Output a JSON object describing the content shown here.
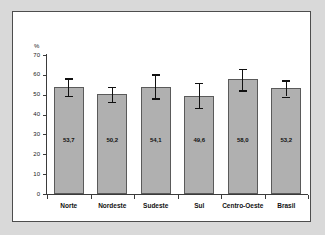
{
  "chart_data": {
    "type": "bar",
    "title": "",
    "xlabel": "",
    "ylabel": "%",
    "ylim": [
      0,
      70
    ],
    "ytick_labels": [
      "70",
      "60",
      "50",
      "40",
      "30",
      "20",
      "10",
      "0"
    ],
    "yticks": [
      70,
      60,
      50,
      40,
      30,
      20,
      10,
      0
    ],
    "grid": false,
    "legend": "none",
    "categories": [
      "Norte",
      "Nordeste",
      "Sudeste",
      "Sul",
      "Centro-Oeste",
      "Brasil"
    ],
    "values": [
      53.7,
      50.2,
      54.1,
      49.6,
      58.0,
      53.2
    ],
    "value_labels": [
      "53,7",
      "50,2",
      "54,1",
      "49,6",
      "58,0",
      "53,2"
    ],
    "error_bars": {
      "lower": [
        49.5,
        46.4,
        48.1,
        43.4,
        52.3,
        49.1
      ],
      "upper": [
        58.2,
        54.0,
        60.3,
        56.0,
        63.1,
        57.3
      ]
    },
    "bar_fill_color": "#b0b0b0",
    "bar_edge_color": "#5a5a5a",
    "error_bar_color": "#111111",
    "plot_background": "#ffffff",
    "page_background": "#d9d9d9"
  }
}
